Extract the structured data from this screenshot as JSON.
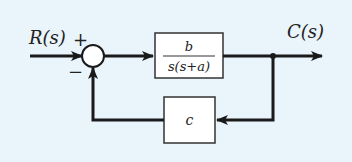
{
  "diagram": {
    "type": "block-diagram",
    "background": "#e9f4fb",
    "line_color": "#1a1a1a",
    "input_label": "R(s)",
    "output_label": "C(s)",
    "summing_junction": {
      "plus_sign": "+",
      "minus_sign": "−"
    },
    "forward_block": {
      "numerator": "b",
      "denominator": "s(s+a)"
    },
    "feedback_block": {
      "gain": "c"
    }
  }
}
